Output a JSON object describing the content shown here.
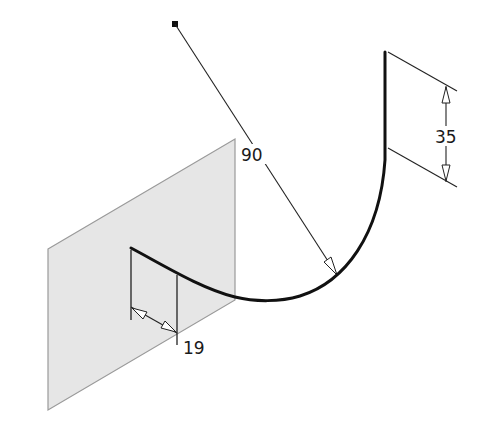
{
  "diagram": {
    "type": "3d sketch / sweep path with dimensions",
    "colors": {
      "background": "#ffffff",
      "plane_fill": "#e6e6e6",
      "plane_edge": "#9a9a9a",
      "curve": "#111111",
      "dimension_line": "#222222"
    },
    "dimensions": {
      "radius": {
        "label": "90",
        "description": "radius of arc"
      },
      "height": {
        "label": "35",
        "description": "vertical extent on right"
      },
      "offset": {
        "label": "19",
        "description": "horizontal offset on work plane"
      }
    },
    "elements": {
      "work_plane": "shaded parallelogram work plane",
      "sweep_path": "curved path starting on work plane, arcing down then up to vertical segment",
      "center_point": "square marker at arc center"
    }
  }
}
